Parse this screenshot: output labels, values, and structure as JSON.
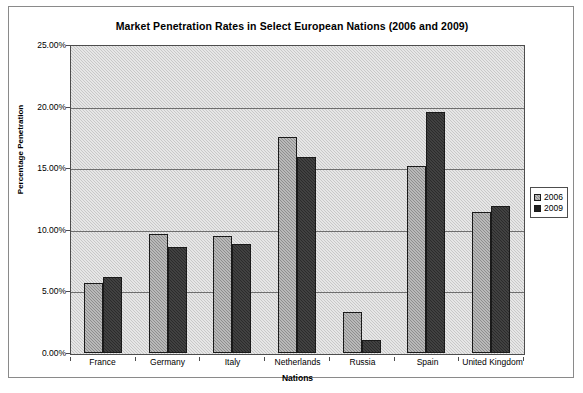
{
  "chart_data": {
    "type": "bar",
    "title": "Market Penetration Rates in Select European Nations (2006 and 2009)",
    "xlabel": "Nations",
    "ylabel": "Percentage Penetration",
    "categories": [
      "France",
      "Germany",
      "Italy",
      "Netherlands",
      "Russia",
      "Spain",
      "United Kingdom"
    ],
    "series": [
      {
        "name": "2006",
        "values": [
          5.7,
          9.7,
          9.5,
          17.6,
          3.3,
          15.2,
          11.5
        ]
      },
      {
        "name": "2009",
        "values": [
          6.2,
          8.6,
          8.9,
          16.0,
          1.1,
          19.6,
          12.0
        ]
      }
    ],
    "ylim": [
      0,
      25
    ],
    "ytick_labels": [
      "25.00%",
      "20.00%",
      "15.00%",
      "10.00%",
      "5.00%",
      "0.00%"
    ],
    "ytick_values": [
      25,
      20,
      15,
      10,
      5,
      0
    ],
    "grid": true,
    "legend_position": "right",
    "colors": {
      "series_2006": "#8e8e8e",
      "series_2009": "#2b2b2b",
      "plot_background": "#c8c8c8",
      "gridline": "#6e6e6e",
      "axis": "#4d4d4d",
      "text": "#000000"
    }
  }
}
